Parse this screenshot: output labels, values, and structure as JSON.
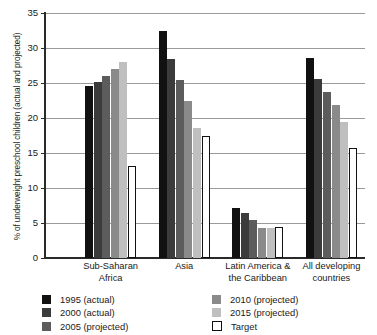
{
  "chart_data": {
    "type": "bar",
    "title": "",
    "xlabel": "",
    "ylabel": "% of underweight preschool children (actual and projected)",
    "ylim": [
      0,
      35
    ],
    "ytick_values": [
      0,
      5,
      10,
      15,
      20,
      25,
      30,
      35
    ],
    "ytick_labels": [
      "0",
      "5",
      "10",
      "15",
      "20",
      "25",
      "30",
      "35"
    ],
    "grid": true,
    "legend_position": "bottom",
    "categories": [
      "Sub-Saharan Africa",
      "Asia",
      "Latin America & the Caribbean",
      "All developing countries"
    ],
    "category_lines": [
      [
        "Sub-Saharan",
        "Africa"
      ],
      [
        "Asia",
        ""
      ],
      [
        "Latin America &",
        "the Caribbean"
      ],
      [
        "All developing",
        "countries"
      ]
    ],
    "series": [
      {
        "name": "1995 (actual)",
        "color": "#111111",
        "values": [
          24.6,
          32.4,
          7.2,
          28.6
        ]
      },
      {
        "name": "2000 (actual)",
        "color": "#3b3b3b",
        "values": [
          25.1,
          28.4,
          6.5,
          25.6
        ]
      },
      {
        "name": "2005 (projected)",
        "color": "#5c5c5c",
        "values": [
          26.0,
          25.4,
          5.4,
          23.7
        ]
      },
      {
        "name": "2010 (projected)",
        "color": "#8a8a8a",
        "values": [
          27.0,
          22.4,
          4.3,
          21.8
        ]
      },
      {
        "name": "2015 (projected)",
        "color": "#bfbfbf",
        "values": [
          28.0,
          18.6,
          4.3,
          19.5
        ]
      },
      {
        "name": "Target",
        "color": "#ffffff",
        "values": [
          13.1,
          17.4,
          4.4,
          15.7
        ]
      }
    ]
  },
  "legend": {
    "left_column": [
      {
        "label": "1995 (actual)",
        "swatch": "legend-swatch-1995"
      },
      {
        "label": "2000 (actual)",
        "swatch": "legend-swatch-2000"
      },
      {
        "label": "2005 (projected)",
        "swatch": "legend-swatch-2005"
      }
    ],
    "right_column": [
      {
        "label": "2010 (projected)",
        "swatch": "legend-swatch-2010"
      },
      {
        "label": "2015 (projected)",
        "swatch": "legend-swatch-2015"
      },
      {
        "label": "Target",
        "swatch": "legend-swatch-target"
      }
    ]
  }
}
